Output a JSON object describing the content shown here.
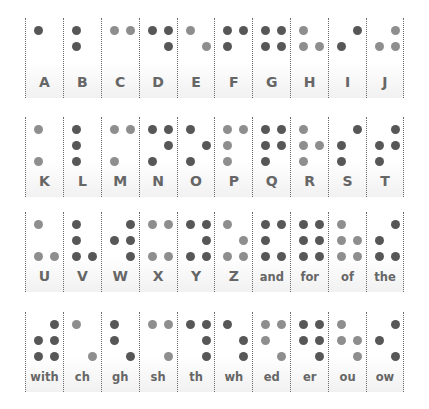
{
  "colors": {
    "dark": "#575757",
    "mid": "#7c7c7c",
    "light": "#8e8e8e",
    "label": "#666666",
    "background": "#ffffff",
    "divider": "#6b6b6b"
  },
  "rows": [
    {
      "cells": [
        {
          "label": "A",
          "dots": [
            1
          ],
          "tone": "dark"
        },
        {
          "label": "B",
          "dots": [
            1,
            2
          ],
          "tone": "dark"
        },
        {
          "label": "C",
          "dots": [
            1,
            4
          ],
          "tone": "light"
        },
        {
          "label": "D",
          "dots": [
            1,
            4,
            5
          ],
          "tone": "dark"
        },
        {
          "label": "E",
          "dots": [
            1,
            5
          ],
          "tone": "light"
        },
        {
          "label": "F",
          "dots": [
            1,
            2,
            4
          ],
          "tone": "dark"
        },
        {
          "label": "G",
          "dots": [
            1,
            2,
            4,
            5
          ],
          "tone": "dark"
        },
        {
          "label": "H",
          "dots": [
            1,
            2,
            5
          ],
          "tone": "light"
        },
        {
          "label": "I",
          "dots": [
            2,
            4
          ],
          "tone": "dark"
        },
        {
          "label": "J",
          "dots": [
            2,
            4,
            5
          ],
          "tone": "light"
        }
      ]
    },
    {
      "cells": [
        {
          "label": "K",
          "dots": [
            1,
            3
          ],
          "tone": "light"
        },
        {
          "label": "L",
          "dots": [
            1,
            2,
            3
          ],
          "tone": "dark"
        },
        {
          "label": "M",
          "dots": [
            1,
            3,
            4
          ],
          "tone": "light"
        },
        {
          "label": "N",
          "dots": [
            1,
            3,
            4,
            5
          ],
          "tone": "dark"
        },
        {
          "label": "O",
          "dots": [
            1,
            3,
            5
          ],
          "tone": "dark"
        },
        {
          "label": "P",
          "dots": [
            1,
            2,
            3,
            4
          ],
          "tone": "light"
        },
        {
          "label": "Q",
          "dots": [
            1,
            2,
            3,
            4,
            5
          ],
          "tone": "dark"
        },
        {
          "label": "R",
          "dots": [
            1,
            2,
            3,
            5
          ],
          "tone": "light"
        },
        {
          "label": "S",
          "dots": [
            2,
            3,
            4
          ],
          "tone": "dark"
        },
        {
          "label": "T",
          "dots": [
            2,
            3,
            4,
            5
          ],
          "tone": "dark"
        }
      ]
    },
    {
      "cells": [
        {
          "label": "U",
          "dots": [
            1,
            3,
            6
          ],
          "tone": "light"
        },
        {
          "label": "V",
          "dots": [
            1,
            2,
            3,
            6
          ],
          "tone": "dark"
        },
        {
          "label": "W",
          "dots": [
            2,
            4,
            5,
            6
          ],
          "tone": "dark"
        },
        {
          "label": "X",
          "dots": [
            1,
            3,
            4,
            6
          ],
          "tone": "light"
        },
        {
          "label": "Y",
          "dots": [
            1,
            3,
            4,
            5,
            6
          ],
          "tone": "dark"
        },
        {
          "label": "Z",
          "dots": [
            1,
            3,
            5,
            6
          ],
          "tone": "light"
        },
        {
          "label": "and",
          "dots": [
            1,
            2,
            3,
            4,
            6
          ],
          "tone": "dark"
        },
        {
          "label": "for",
          "dots": [
            1,
            2,
            3,
            4,
            5,
            6
          ],
          "tone": "dark"
        },
        {
          "label": "of",
          "dots": [
            1,
            2,
            3,
            5,
            6
          ],
          "tone": "light"
        },
        {
          "label": "the",
          "dots": [
            2,
            3,
            4,
            6
          ],
          "tone": "dark"
        }
      ]
    },
    {
      "cells": [
        {
          "label": "with",
          "dots": [
            2,
            3,
            4,
            5,
            6
          ],
          "tone": "dark"
        },
        {
          "label": "ch",
          "dots": [
            1,
            6
          ],
          "tone": "light"
        },
        {
          "label": "gh",
          "dots": [
            1,
            2,
            6
          ],
          "tone": "dark"
        },
        {
          "label": "sh",
          "dots": [
            1,
            4,
            6
          ],
          "tone": "light"
        },
        {
          "label": "th",
          "dots": [
            1,
            4,
            5,
            6
          ],
          "tone": "dark"
        },
        {
          "label": "wh",
          "dots": [
            1,
            5,
            6
          ],
          "tone": "dark"
        },
        {
          "label": "ed",
          "dots": [
            1,
            2,
            4,
            6
          ],
          "tone": "light"
        },
        {
          "label": "er",
          "dots": [
            1,
            2,
            4,
            5,
            6
          ],
          "tone": "dark"
        },
        {
          "label": "ou",
          "dots": [
            1,
            2,
            5,
            6
          ],
          "tone": "light"
        },
        {
          "label": "ow",
          "dots": [
            2,
            4,
            6
          ],
          "tone": "dark"
        }
      ]
    }
  ]
}
